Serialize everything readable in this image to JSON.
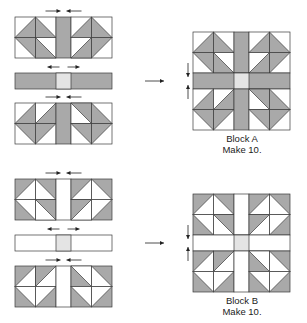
{
  "colors": {
    "shade": "#a9a9a9",
    "light": "#ffffff",
    "center": "#e4e4e4",
    "line": "#3a3a3a",
    "arrow": "#222222"
  },
  "blocks": [
    {
      "id": "A",
      "label": "Block A",
      "note": "Make 10.",
      "inverted": false,
      "pieces": {
        "top_row_y": 17,
        "strip_y": 73,
        "bottom_row_y": 103,
        "x": 15
      },
      "assembled": {
        "x": 193,
        "y": 32
      },
      "caption_y": 133,
      "arrow_y": 81
    },
    {
      "id": "B",
      "label": "Block B",
      "note": "Make 10.",
      "inverted": true,
      "pieces": {
        "top_row_y": 179,
        "strip_y": 235,
        "bottom_row_y": 266,
        "x": 15
      },
      "assembled": {
        "x": 193,
        "y": 194
      },
      "caption_y": 295,
      "arrow_y": 243
    }
  ],
  "geometry": {
    "cell": 20.5,
    "strip_width": 15,
    "note": "unit = 2x2 cells; each cell has one right triangle with right angle at listed corner"
  },
  "units": {
    "top_left": [
      "br",
      "bl",
      "tr",
      "bl"
    ],
    "top_right": [
      "br",
      "bl",
      "br",
      "tl"
    ],
    "bottom_left": [
      "br",
      "br",
      "tr",
      "tl"
    ],
    "bottom_right": [
      "tr",
      "bl",
      "tr",
      "tl"
    ]
  },
  "press_arrows": {
    "rows": "inward",
    "strip": "outward",
    "assembled_seams": "outward-vertical"
  }
}
